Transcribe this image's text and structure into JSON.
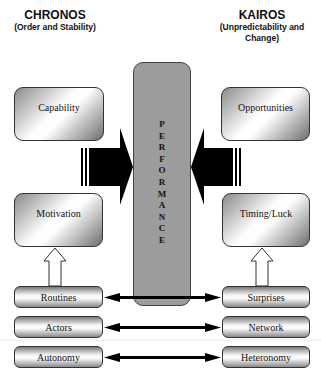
{
  "left_header": {
    "title": "CHRONOS",
    "subtitle": "(Order and Stability)"
  },
  "right_header": {
    "title": "KAIROS",
    "subtitle": "(Unpredictability and Change)"
  },
  "center": {
    "label": "PERFORMANCE",
    "letters": [
      "P",
      "E",
      "R",
      "F",
      "O",
      "R",
      "M",
      "A",
      "N",
      "C",
      "E"
    ]
  },
  "left_boxes": {
    "top": "Capability",
    "bottom": "Motivation"
  },
  "right_boxes": {
    "top": "Opportunities",
    "bottom": "Timing/Luck"
  },
  "left_bars": [
    "Routines",
    "Actors",
    "Autonomy"
  ],
  "right_bars": [
    "Surprises",
    "Network",
    "Heteronomy"
  ],
  "colors": {
    "center_fill": "#9c9c9c",
    "arrow": "#000000",
    "border": "#333333"
  }
}
